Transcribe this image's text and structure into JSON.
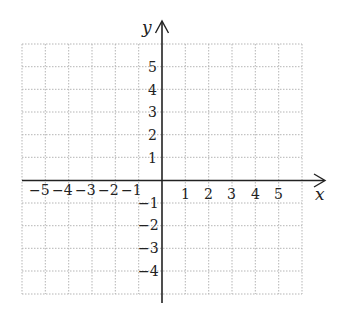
{
  "diagram": {
    "type": "coordinate-grid",
    "x_axis_label": "x",
    "y_axis_label": "y",
    "x_range": [
      -6,
      6
    ],
    "y_range": [
      -5,
      6
    ],
    "x_tick_labels": {
      "negative": [
        "−5",
        "−4",
        "−3",
        "−2",
        "−1"
      ],
      "positive": [
        "1",
        "2",
        "3",
        "4",
        "5"
      ]
    },
    "y_tick_labels": {
      "positive": [
        "5",
        "4",
        "3",
        "2",
        "1"
      ],
      "negative": [
        "−1",
        "−2",
        "−3",
        "−4"
      ]
    },
    "grid_style": "dotted",
    "colors": {
      "axis": "#222222",
      "grid": "#b0b0b0",
      "background": "#ffffff"
    }
  }
}
